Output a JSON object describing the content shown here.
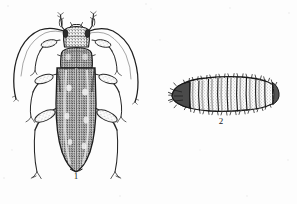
{
  "plate": {
    "title": "Entomological plate: adult beetle and larva",
    "background_color": "#fdfdfd",
    "ink_color": "#1a1a1a",
    "width": 297,
    "height": 204,
    "medium": "scanned pen-and-ink line drawing with stipple shading"
  },
  "figures": [
    {
      "id": "figure-1",
      "label": "1",
      "subject": "adult longhorn beetle",
      "view": "dorsal",
      "parts": [
        "head",
        "compound-eyes",
        "mandibles",
        "left-antenna",
        "right-antenna",
        "pronotum",
        "scutellum",
        "elytra",
        "elytral-suture",
        "fore-legs",
        "mid-legs",
        "hind-legs",
        "tarsi"
      ],
      "shading": "dense stipple on pronotum and elytra",
      "label_position": {
        "x": 70,
        "y": 172
      }
    },
    {
      "id": "figure-2",
      "label": "2",
      "subject": "beetle larva (grub)",
      "view": "lateral",
      "parts": [
        "head-capsule",
        "mandibles",
        "thoracic-segments",
        "abdominal-segments",
        "setae",
        "terminal-segment"
      ],
      "segment_count": 12,
      "shading": "dark segment outlines with bristles along dorsal and ventral margins",
      "label_position": {
        "x": 215,
        "y": 117
      }
    }
  ],
  "labels": {
    "figure_one": "1",
    "figure_two": "2"
  }
}
